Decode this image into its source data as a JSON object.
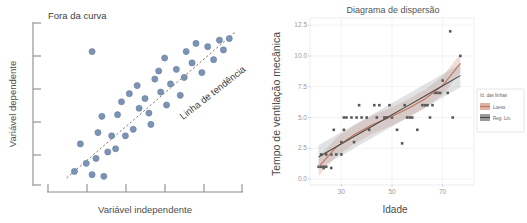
{
  "left": {
    "annotations": {
      "outlier_label": "Fora da curva",
      "trend_label": "Linha de tendência"
    },
    "chart_data": {
      "type": "scatter",
      "title": "",
      "xlabel": "Variável independente",
      "ylabel": "Variável dependente",
      "xlim": [
        0,
        100
      ],
      "ylim": [
        0,
        100
      ],
      "grid": false,
      "xticks": [
        10,
        30,
        50,
        70,
        90
      ],
      "yticks": [
        10,
        30,
        50,
        70,
        90
      ],
      "xticklabels": [
        "",
        "",
        "",
        "",
        ""
      ],
      "yticklabels": [
        "",
        "",
        "",
        "",
        ""
      ],
      "annotations": [
        {
          "text": "Fora da curva",
          "x": 22,
          "y": 97
        },
        {
          "text": "Linha de tendência",
          "x": 78,
          "y": 62,
          "rotation": -37
        }
      ],
      "series": [
        {
          "name": "Outlier",
          "points": [
            [
              23,
              83
            ]
          ]
        },
        {
          "name": "Pontos",
          "points": [
            [
              14,
              9
            ],
            [
              20,
              14
            ],
            [
              17,
              26
            ],
            [
              25,
              17
            ],
            [
              23,
              7
            ],
            [
              29,
              6
            ],
            [
              26,
              33
            ],
            [
              33,
              31
            ],
            [
              31,
              21
            ],
            [
              28,
              43
            ],
            [
              36,
              44
            ],
            [
              35,
              23
            ],
            [
              40,
              31
            ],
            [
              38,
              52
            ],
            [
              44,
              35
            ],
            [
              42,
              57
            ],
            [
              47,
              48
            ],
            [
              46,
              62
            ],
            [
              50,
              54
            ],
            [
              52,
              45
            ],
            [
              55,
              66
            ],
            [
              53,
              38
            ],
            [
              58,
              58
            ],
            [
              57,
              71
            ],
            [
              61,
              50
            ],
            [
              63,
              63
            ],
            [
              60,
              79
            ],
            [
              66,
              72
            ],
            [
              68,
              56
            ],
            [
              71,
              83
            ],
            [
              70,
              67
            ],
            [
              74,
              76
            ],
            [
              76,
              88
            ],
            [
              79,
              70
            ],
            [
              82,
              86
            ],
            [
              85,
              78
            ],
            [
              88,
              90
            ],
            [
              90,
              84
            ],
            [
              93,
              91
            ]
          ]
        }
      ],
      "trendline": {
        "name": "Linha de tendência",
        "x0": 10,
        "y0": 5,
        "x1": 96,
        "y1": 95,
        "style": "dashed"
      }
    }
  },
  "right": {
    "chart_data": {
      "type": "scatter",
      "title": "Diagrama de dispersão",
      "xlabel": "Idade",
      "ylabel": "Tempo de ventilação mecânica",
      "xlim": [
        18,
        82
      ],
      "ylim": [
        -0.4,
        13.0
      ],
      "grid": true,
      "xticks": [
        30,
        50,
        70
      ],
      "yticks": [
        0.0,
        2.5,
        5.0,
        7.5,
        10.0,
        12.5
      ],
      "xticklabels": [
        "30",
        "50",
        "70"
      ],
      "yticklabels": [
        "0.0",
        "2.5",
        "5.0",
        "7.5",
        "10.0",
        "12.5"
      ],
      "legend": {
        "title": "Id. das linhas",
        "position": "right",
        "entries": [
          {
            "label": "Loess",
            "color": "#c2755a"
          },
          {
            "label": "Reg. Lin.",
            "color": "#4a4a4a"
          }
        ]
      },
      "series": [
        {
          "name": "Observações",
          "points": [
            [
              21,
              1
            ],
            [
              22,
              1
            ],
            [
              22,
              2
            ],
            [
              23,
              1
            ],
            [
              24,
              1
            ],
            [
              24,
              2
            ],
            [
              23,
              0.9
            ],
            [
              26,
              0.9
            ],
            [
              26,
              2
            ],
            [
              28,
              2
            ],
            [
              27,
              4
            ],
            [
              30,
              3
            ],
            [
              31,
              4
            ],
            [
              31,
              5
            ],
            [
              32,
              5
            ],
            [
              30,
              2
            ],
            [
              34,
              5
            ],
            [
              35,
              3
            ],
            [
              36,
              5
            ],
            [
              37,
              6
            ],
            [
              38,
              5
            ],
            [
              40,
              5
            ],
            [
              41,
              4
            ],
            [
              43,
              6
            ],
            [
              45,
              6
            ],
            [
              44,
              5
            ],
            [
              47,
              5
            ],
            [
              48,
              5
            ],
            [
              50,
              5
            ],
            [
              49,
              6
            ],
            [
              52,
              4
            ],
            [
              55,
              6
            ],
            [
              56,
              5
            ],
            [
              57,
              5
            ],
            [
              58,
              5
            ],
            [
              54,
              2.9
            ],
            [
              60,
              4
            ],
            [
              62,
              6
            ],
            [
              63,
              6
            ],
            [
              64,
              6
            ],
            [
              65,
              5
            ],
            [
              67,
              7
            ],
            [
              68,
              7
            ],
            [
              69,
              7
            ],
            [
              70,
              8
            ],
            [
              66,
              6
            ],
            [
              73,
              12
            ],
            [
              74,
              5
            ],
            [
              77,
              10
            ],
            [
              72,
              7
            ]
          ]
        }
      ],
      "fits": [
        {
          "name": "Loess",
          "color": "#c2755a",
          "band": true,
          "points": [
            [
              21,
              1.0
            ],
            [
              28,
              2.6
            ],
            [
              35,
              3.6
            ],
            [
              42,
              4.4
            ],
            [
              49,
              5.0
            ],
            [
              56,
              5.7
            ],
            [
              63,
              6.5
            ],
            [
              70,
              7.6
            ],
            [
              77,
              9.4
            ]
          ]
        },
        {
          "name": "Reg. Lin.",
          "color": "#4a4a4a",
          "band": true,
          "points": [
            [
              21,
              1.8
            ],
            [
              77,
              8.4
            ]
          ]
        }
      ]
    }
  }
}
